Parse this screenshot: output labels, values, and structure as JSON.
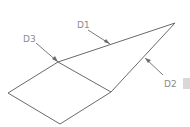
{
  "diagram": {
    "type": "surface-outline",
    "colors": {
      "line": "#6a6a6a",
      "label": "#8a8a8a",
      "background": "#ffffff"
    },
    "labels": [
      {
        "id": "D1",
        "text": "D1"
      },
      {
        "id": "D2",
        "text": "D2"
      },
      {
        "id": "D3",
        "text": "D3"
      }
    ]
  }
}
